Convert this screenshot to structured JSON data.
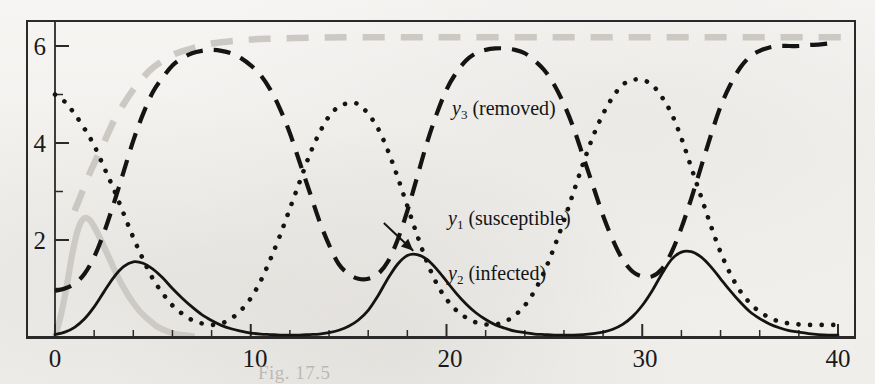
{
  "figure": {
    "kind": "scanned-textbook-figure",
    "background_color": "#f4f3f1",
    "ink_color": "#141414",
    "ghost_color": "#c9c6c1"
  },
  "axes": {
    "x_tick_labels": [
      "0",
      "10",
      "20",
      "30",
      "40"
    ],
    "y_tick_labels": [
      "2",
      "4",
      "6"
    ],
    "x_minor_ticks_per_major": 5,
    "y_minor_ticks_per_major": 2,
    "frame": "full-box"
  },
  "series_labels": {
    "y3": {
      "symbol": "y",
      "sub": "3",
      "text": " (removed)"
    },
    "y1": {
      "symbol": "y",
      "sub": "1",
      "text": " (susceptible)"
    },
    "y2": {
      "symbol": "y",
      "sub": "2",
      "text": " (infected)"
    }
  },
  "ghost_caption": "Fig. 17.5   ",
  "chart_data": {
    "type": "line",
    "title": "",
    "xlabel": "",
    "ylabel": "",
    "xlim": [
      -1.2,
      41.5
    ],
    "ylim": [
      -0.18,
      6.55
    ],
    "xticks": [
      0,
      10,
      20,
      30,
      40
    ],
    "yticks": [
      2,
      4,
      6
    ],
    "grid": false,
    "legend": "inline-annotations",
    "series": [
      {
        "name": "y_3 (removed)",
        "label": "y3 (removed)",
        "style": "dashed",
        "color": "#141414",
        "x": [
          0,
          0.5,
          1,
          1.5,
          2,
          2.5,
          3,
          3.5,
          4,
          4.5,
          5,
          5.5,
          6,
          6.5,
          7,
          7.5,
          8,
          8.5,
          9,
          9.5,
          10,
          10.5,
          11,
          11.5,
          12,
          12.5,
          13,
          13.5,
          14,
          14.5,
          15,
          15.5,
          16,
          16.5,
          17,
          17.5,
          18,
          18.5,
          19,
          19.5,
          20,
          20.5,
          21,
          21.5,
          22,
          22.5,
          23,
          23.5,
          24,
          24.5,
          25,
          25.5,
          26,
          26.5,
          27,
          27.5,
          28,
          28.5,
          29,
          29.5,
          30,
          30.5,
          31,
          31.5,
          32,
          32.5,
          33,
          33.5,
          34,
          34.5,
          35,
          35.5,
          36,
          36.5,
          37,
          37.5,
          38,
          38.5,
          39,
          39.5,
          40
        ],
        "y": [
          0.95,
          1.0,
          1.1,
          1.3,
          1.65,
          2.15,
          2.75,
          3.4,
          4.05,
          4.6,
          5.05,
          5.35,
          5.6,
          5.75,
          5.85,
          5.9,
          5.92,
          5.9,
          5.85,
          5.75,
          5.6,
          5.4,
          5.1,
          4.7,
          4.2,
          3.6,
          3.0,
          2.4,
          1.9,
          1.5,
          1.3,
          1.2,
          1.2,
          1.3,
          1.55,
          2.0,
          2.6,
          3.3,
          4.0,
          4.6,
          5.1,
          5.45,
          5.7,
          5.85,
          5.92,
          5.95,
          5.95,
          5.92,
          5.85,
          5.7,
          5.5,
          5.2,
          4.8,
          4.3,
          3.7,
          3.1,
          2.5,
          2.0,
          1.6,
          1.35,
          1.25,
          1.25,
          1.4,
          1.75,
          2.25,
          2.85,
          3.5,
          4.15,
          4.75,
          5.2,
          5.55,
          5.78,
          5.9,
          5.97,
          6.0,
          6.0,
          6.0,
          6.02,
          6.03,
          6.05,
          6.08
        ]
      },
      {
        "name": "y_1 (susceptible)",
        "label": "y1 (susceptible)",
        "style": "dotted",
        "color": "#141414",
        "x": [
          0,
          0.5,
          1,
          1.5,
          2,
          2.5,
          3,
          3.5,
          4,
          4.5,
          5,
          5.5,
          6,
          6.5,
          7,
          7.5,
          8,
          8.5,
          9,
          9.5,
          10,
          10.5,
          11,
          11.5,
          12,
          12.5,
          13,
          13.5,
          14,
          14.5,
          15,
          15.5,
          16,
          16.5,
          17,
          17.5,
          18,
          18.5,
          19,
          19.5,
          20,
          20.5,
          21,
          21.5,
          22,
          22.5,
          23,
          23.5,
          24,
          24.5,
          25,
          25.5,
          26,
          26.5,
          27,
          27.5,
          28,
          28.5,
          29,
          29.5,
          30,
          30.5,
          31,
          31.5,
          32,
          32.5,
          33,
          33.5,
          34,
          34.5,
          35,
          35.5,
          36,
          36.5,
          37,
          37.5,
          38,
          38.5,
          39,
          39.5,
          40
        ],
        "y": [
          5.0,
          4.85,
          4.6,
          4.3,
          3.95,
          3.5,
          3.05,
          2.55,
          2.05,
          1.6,
          1.2,
          0.9,
          0.65,
          0.48,
          0.35,
          0.28,
          0.25,
          0.28,
          0.38,
          0.55,
          0.8,
          1.15,
          1.6,
          2.1,
          2.65,
          3.2,
          3.75,
          4.2,
          4.55,
          4.75,
          4.82,
          4.8,
          4.6,
          4.3,
          3.85,
          3.3,
          2.7,
          2.1,
          1.55,
          1.1,
          0.78,
          0.55,
          0.4,
          0.3,
          0.26,
          0.26,
          0.32,
          0.45,
          0.65,
          0.95,
          1.35,
          1.85,
          2.4,
          3.0,
          3.6,
          4.15,
          4.6,
          4.95,
          5.2,
          5.3,
          5.3,
          5.2,
          4.95,
          4.6,
          4.1,
          3.5,
          2.9,
          2.3,
          1.75,
          1.3,
          0.95,
          0.7,
          0.52,
          0.4,
          0.32,
          0.28,
          0.26,
          0.25,
          0.25,
          0.25,
          0.25
        ]
      },
      {
        "name": "y_2 (infected)",
        "label": "y2 (infected)",
        "style": "solid",
        "color": "#141414",
        "x": [
          0,
          0.5,
          1,
          1.5,
          2,
          2.5,
          3,
          3.5,
          4,
          4.5,
          5,
          5.5,
          6,
          6.5,
          7,
          7.5,
          8,
          8.5,
          9,
          9.5,
          10,
          10.5,
          11,
          11.5,
          12,
          12.5,
          13,
          13.5,
          14,
          14.5,
          15,
          15.5,
          16,
          16.5,
          17,
          17.5,
          18,
          18.5,
          19,
          19.5,
          20,
          20.5,
          21,
          21.5,
          22,
          22.5,
          23,
          23.5,
          24,
          24.5,
          25,
          25.5,
          26,
          26.5,
          27,
          27.5,
          28,
          28.5,
          29,
          29.5,
          30,
          30.5,
          31,
          31.5,
          32,
          32.5,
          33,
          33.5,
          34,
          34.5,
          35,
          35.5,
          36,
          36.5,
          37,
          37.5,
          38,
          38.5,
          39,
          39.5,
          40
        ],
        "y": [
          0.05,
          0.1,
          0.2,
          0.37,
          0.62,
          0.93,
          1.23,
          1.45,
          1.55,
          1.52,
          1.4,
          1.22,
          1.0,
          0.8,
          0.62,
          0.46,
          0.34,
          0.24,
          0.17,
          0.12,
          0.08,
          0.06,
          0.05,
          0.04,
          0.04,
          0.04,
          0.05,
          0.06,
          0.09,
          0.14,
          0.22,
          0.35,
          0.55,
          0.85,
          1.2,
          1.5,
          1.68,
          1.7,
          1.6,
          1.4,
          1.15,
          0.9,
          0.68,
          0.5,
          0.36,
          0.25,
          0.18,
          0.12,
          0.09,
          0.06,
          0.05,
          0.04,
          0.04,
          0.04,
          0.05,
          0.07,
          0.1,
          0.16,
          0.26,
          0.42,
          0.65,
          0.95,
          1.3,
          1.6,
          1.75,
          1.76,
          1.65,
          1.45,
          1.2,
          0.95,
          0.72,
          0.52,
          0.38,
          0.27,
          0.19,
          0.13,
          0.1,
          0.07,
          0.05,
          0.04,
          0.04
        ]
      }
    ],
    "ghost_series": [
      {
        "name": "ghost-dashed-rising",
        "style": "dashed",
        "color": "#c9c6c1",
        "x": [
          1.0,
          1.4,
          1.8,
          2.2,
          2.6,
          3.0,
          3.5,
          4.0,
          4.5,
          5.0,
          5.6,
          6.2,
          7.0,
          8.0,
          9.5,
          11,
          13,
          15,
          18,
          21,
          25,
          29,
          33,
          37,
          40.5
        ],
        "y": [
          2.6,
          3.0,
          3.4,
          3.75,
          4.1,
          4.45,
          4.8,
          5.1,
          5.35,
          5.55,
          5.72,
          5.85,
          5.95,
          6.05,
          6.12,
          6.15,
          6.17,
          6.18,
          6.18,
          6.18,
          6.18,
          6.18,
          6.18,
          6.18,
          6.18
        ]
      },
      {
        "name": "ghost-solid-peak",
        "style": "solid",
        "color": "#cbc8c3",
        "x": [
          0.0,
          0.3,
          0.6,
          0.9,
          1.2,
          1.5,
          1.8,
          2.1,
          2.4,
          2.8,
          3.2,
          3.6,
          4.0,
          4.4,
          4.8,
          5.2,
          5.6,
          6.0,
          6.5,
          7.0
        ],
        "y": [
          0.0,
          0.45,
          1.05,
          1.75,
          2.25,
          2.45,
          2.4,
          2.2,
          1.95,
          1.6,
          1.25,
          0.95,
          0.7,
          0.5,
          0.35,
          0.22,
          0.14,
          0.08,
          0.04,
          0.02
        ]
      }
    ],
    "annotations": [
      {
        "name": "y1-arrow",
        "from_x": 16.8,
        "from_y": 2.35,
        "to_x": 18.3,
        "to_y": 1.78
      }
    ]
  }
}
